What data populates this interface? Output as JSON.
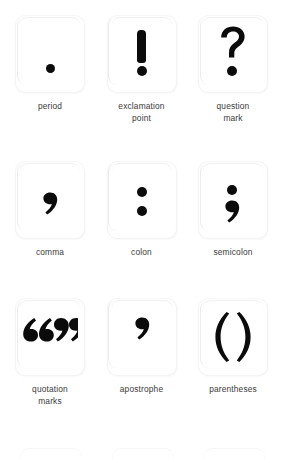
{
  "page": {
    "background_color": "#ffffff",
    "glyph_color": "#0b0b0b",
    "label_color": "#3b3b3b"
  },
  "rows": [
    {
      "cells": [
        {
          "symbol": ".",
          "symbol_name": "period-glyph",
          "label": "period"
        },
        {
          "symbol": "!",
          "symbol_name": "exclamation-point-glyph",
          "label": "exclamation\npoint"
        },
        {
          "symbol": "?",
          "symbol_name": "question-mark-glyph",
          "label": "question\nmark"
        }
      ]
    },
    {
      "cells": [
        {
          "symbol": ",",
          "symbol_name": "comma-glyph",
          "label": "comma"
        },
        {
          "symbol": ":",
          "symbol_name": "colon-glyph",
          "label": "colon"
        },
        {
          "symbol": ";",
          "symbol_name": "semicolon-glyph",
          "label": "semicolon"
        }
      ]
    },
    {
      "cells": [
        {
          "symbol": "“”",
          "symbol_name": "quotation-marks-glyph",
          "label": "quotation\nmarks"
        },
        {
          "symbol": "’",
          "symbol_name": "apostrophe-glyph",
          "label": "apostrophe"
        },
        {
          "symbol": "( )",
          "symbol_name": "parentheses-glyph",
          "label": "parentheses"
        }
      ]
    },
    {
      "partial": true,
      "cells": [
        {
          "symbol": "",
          "symbol_name": "card-top-edge",
          "label": ""
        },
        {
          "symbol": "",
          "symbol_name": "card-top-edge",
          "label": ""
        },
        {
          "symbol": "",
          "symbol_name": "card-top-edge",
          "label": ""
        }
      ]
    }
  ]
}
